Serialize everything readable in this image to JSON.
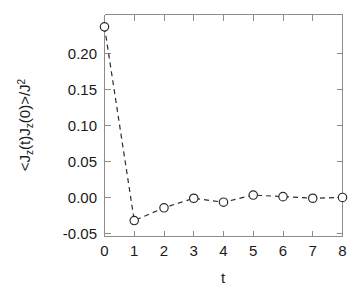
{
  "chart_data": {
    "type": "line",
    "title": "",
    "subtitle": "",
    "xlabel": "t",
    "ylabel": "<J_z(t)J_z(0)>/J^2",
    "ylabel_parts": {
      "open_bracket": "<",
      "j1": "J",
      "sub1": "z",
      "paren1": "(t)",
      "j2": "J",
      "sub2": "z",
      "paren2": "(0)",
      "close_bracket": ">",
      "slash": "/J",
      "sup": "2"
    },
    "x": [
      0,
      1,
      2,
      3,
      4,
      5,
      6,
      7,
      8
    ],
    "values": [
      0.213,
      -0.03,
      -0.014,
      -0.002,
      -0.007,
      0.002,
      0.0,
      -0.002,
      -0.001
    ],
    "series": [
      {
        "name": "Jz autocorrelation",
        "values": [
          0.213,
          -0.03,
          -0.014,
          -0.002,
          -0.007,
          0.002,
          0.0,
          -0.002,
          -0.001
        ]
      }
    ],
    "xlim": [
      0,
      8
    ],
    "ylim": [
      -0.05,
      0.2285
    ],
    "xticks": [
      0,
      1,
      2,
      3,
      4,
      5,
      6,
      7,
      8
    ],
    "xtick_labels": [
      "0",
      "1",
      "2",
      "3",
      "4",
      "5",
      "6",
      "7",
      "8"
    ],
    "yticks": [
      -0.05,
      0.0,
      0.05,
      0.1,
      0.15,
      0.2
    ],
    "ytick_labels": [
      "-0.05",
      "0.00",
      "0.05",
      "0.10",
      "0.15",
      "0.20"
    ],
    "grid": false,
    "legend": null,
    "legend_position": "none",
    "marker": "open-circle",
    "linestyle": "dashed",
    "line_color": "#2b2b2b",
    "marker_face_color": "#ffffff",
    "frame_color": "#8c8c8c",
    "background_color": "#ffffff",
    "annotations": []
  }
}
